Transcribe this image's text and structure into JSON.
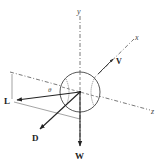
{
  "diagram": {
    "type": "free-body-diagram",
    "axes": {
      "y": {
        "label": "y"
      },
      "x": {
        "label": "x"
      },
      "z": {
        "label": "z"
      }
    },
    "vectors": {
      "velocity": {
        "label": "V"
      },
      "lift": {
        "label": "L"
      },
      "drag": {
        "label": "D"
      },
      "weight": {
        "label": "W"
      }
    },
    "angle": {
      "label": "θ"
    },
    "colors": {
      "ink": "#222222",
      "dashed_axis": "#555555",
      "thin_line": "#666666"
    }
  }
}
